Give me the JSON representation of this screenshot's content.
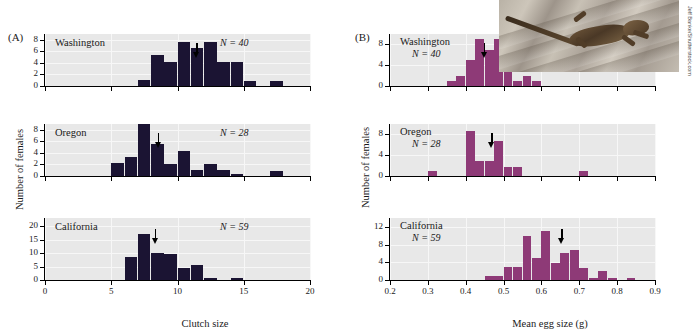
{
  "figure": {
    "panel_a_letter": "(A)",
    "panel_b_letter": "(B)",
    "y_axis_title": "Number of females",
    "photo_credit": "Jeff Banke/Shutterstock.com",
    "photo_alt": "lizard-on-wood-photo",
    "colors": {
      "panel_a_bar": "#1b1433",
      "panel_b_bar": "#8e3a77",
      "plot_background": "#e8e8e8",
      "gridline": "#f7f7f7",
      "axis": "#000000"
    }
  },
  "chart_data": [
    {
      "type": "bar",
      "id": "a-washington",
      "title": "Washington",
      "annotation": "N = 40",
      "n_label_prefix": "N",
      "n_label_value": "= 40",
      "xlabel": "Clutch size",
      "ylabel": "Number of females",
      "xlim": [
        0,
        20
      ],
      "ylim": [
        0,
        9
      ],
      "xticks": [
        0,
        5,
        10,
        15,
        20
      ],
      "xtick_labels": [
        "0",
        "5",
        "10",
        "15",
        "20"
      ],
      "yticks": [
        0,
        2,
        4,
        6,
        8
      ],
      "ytick_labels": [
        "0",
        "2",
        "4",
        "6",
        "8"
      ],
      "bin_width": 1,
      "bins": [
        7,
        8,
        9,
        10,
        11,
        12,
        13,
        14,
        15,
        17
      ],
      "values": [
        1,
        5.4,
        4.2,
        7.6,
        6.5,
        7.6,
        4.2,
        4.2,
        0.9,
        0.9
      ],
      "arrow_x": 11.4,
      "grid": true
    },
    {
      "type": "bar",
      "id": "a-oregon",
      "title": "Oregon",
      "annotation": "N = 28",
      "n_label_prefix": "N",
      "n_label_value": "= 28",
      "xlabel": "Clutch size",
      "ylabel": "Number of females",
      "xlim": [
        0,
        20
      ],
      "ylim": [
        0,
        9
      ],
      "xticks": [
        0,
        5,
        10,
        15,
        20
      ],
      "xtick_labels": [
        "0",
        "5",
        "10",
        "15",
        "20"
      ],
      "yticks": [
        0,
        2,
        4,
        6,
        8
      ],
      "ytick_labels": [
        "0",
        "2",
        "4",
        "6",
        "8"
      ],
      "bin_width": 1,
      "bins": [
        5,
        6,
        7,
        8,
        9,
        10,
        11,
        12,
        13,
        14,
        17
      ],
      "values": [
        2.2,
        3.3,
        9,
        5.6,
        2.1,
        4.3,
        1.1,
        2.1,
        1.1,
        0.4,
        0.9
      ],
      "arrow_x": 8.5,
      "grid": true
    },
    {
      "type": "bar",
      "id": "a-california",
      "title": "California",
      "annotation": "N = 59",
      "n_label_prefix": "N",
      "n_label_value": "= 59",
      "xlabel": "Clutch size",
      "ylabel": "Number of females",
      "xlim": [
        0,
        20
      ],
      "ylim": [
        0,
        23
      ],
      "xticks": [
        0,
        5,
        10,
        15,
        20
      ],
      "xtick_labels": [
        "0",
        "5",
        "10",
        "15",
        "20"
      ],
      "yticks": [
        0,
        5,
        10,
        15,
        20
      ],
      "ytick_labels": [
        "0",
        "5",
        "10",
        "15",
        "20"
      ],
      "bin_width": 1,
      "bins": [
        6,
        7,
        8,
        9,
        10,
        11,
        12,
        14
      ],
      "values": [
        8.7,
        17,
        9.9,
        9.8,
        4.6,
        5.7,
        0.6,
        0.6
      ],
      "arrow_x": 8.3,
      "grid": true
    },
    {
      "type": "bar",
      "id": "b-washington",
      "title": "Washington",
      "annotation": "N = 40",
      "n_label_prefix": "N",
      "n_label_value": "= 40",
      "xlabel": "Mean egg size (g)",
      "ylabel": "Number of females",
      "xlim": [
        0.2,
        0.9
      ],
      "ylim": [
        0,
        10
      ],
      "xticks": [
        0.2,
        0.3,
        0.4,
        0.5,
        0.6,
        0.7,
        0.8,
        0.9
      ],
      "xtick_labels": [
        "0.2",
        "0.3",
        "0.4",
        "0.5",
        "0.6",
        "0.7",
        "0.8",
        "0.9"
      ],
      "yticks": [
        0,
        4,
        8
      ],
      "ytick_labels": [
        "0",
        "4",
        "8"
      ],
      "bin_width": 0.025,
      "bins": [
        0.35,
        0.375,
        0.4,
        0.425,
        0.45,
        0.475,
        0.5,
        0.525,
        0.55
      ],
      "values": [
        1,
        2,
        5,
        9,
        7,
        9,
        3,
        1,
        2
      ],
      "extra_bins": [
        0.575
      ],
      "extra_values": [
        1
      ],
      "arrow_x": 0.448,
      "grid": true
    },
    {
      "type": "bar",
      "id": "b-oregon",
      "title": "Oregon",
      "annotation": "N = 28",
      "n_label_prefix": "N",
      "n_label_value": "= 28",
      "xlabel": "Mean egg size (g)",
      "ylabel": "Number of females",
      "xlim": [
        0.2,
        0.9
      ],
      "ylim": [
        0,
        10
      ],
      "xticks": [
        0.2,
        0.3,
        0.4,
        0.5,
        0.6,
        0.7,
        0.8,
        0.9
      ],
      "xtick_labels": [
        "0.2",
        "0.3",
        "0.4",
        "0.5",
        "0.6",
        "0.7",
        "0.8",
        "0.9"
      ],
      "yticks": [
        0,
        4,
        8
      ],
      "ytick_labels": [
        "0",
        "4",
        "8"
      ],
      "bin_width": 0.025,
      "bins": [
        0.3,
        0.4,
        0.425,
        0.45,
        0.475,
        0.5,
        0.525,
        0.7
      ],
      "values": [
        1,
        8.6,
        2.8,
        2.8,
        6.7,
        1.8,
        1.8,
        1
      ],
      "arrow_x": 0.468,
      "grid": true
    },
    {
      "type": "bar",
      "id": "b-california",
      "title": "California",
      "annotation": "N = 59",
      "n_label_prefix": "N",
      "n_label_value": "= 59",
      "xlabel": "Mean egg size (g)",
      "ylabel": "Number of females",
      "xlim": [
        0.2,
        0.9
      ],
      "ylim": [
        0,
        14
      ],
      "xticks": [
        0.2,
        0.3,
        0.4,
        0.5,
        0.6,
        0.7,
        0.8,
        0.9
      ],
      "xtick_labels": [
        "0.2",
        "0.3",
        "0.4",
        "0.5",
        "0.6",
        "0.7",
        "0.8",
        "0.9"
      ],
      "yticks": [
        0,
        4,
        8,
        12
      ],
      "ytick_labels": [
        "0",
        "4",
        "8",
        "12"
      ],
      "bin_width": 0.025,
      "bins": [
        0.45,
        0.475,
        0.5,
        0.525,
        0.55,
        0.575,
        0.6,
        0.625,
        0.65,
        0.675,
        0.7,
        0.725,
        0.75,
        0.775,
        0.825
      ],
      "values": [
        1,
        1,
        3,
        3,
        10,
        5,
        11,
        3.8,
        6,
        6.7,
        2.7,
        0.5,
        2,
        0.5,
        0.5
      ],
      "arrow_x": 0.652,
      "grid": true
    }
  ]
}
